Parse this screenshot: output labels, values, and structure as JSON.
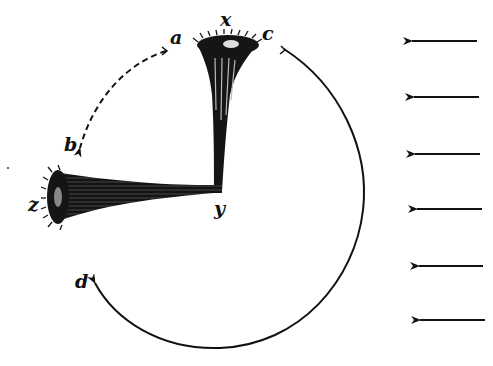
{
  "figure": {
    "labels": {
      "a": "a",
      "b": "b",
      "c": "c",
      "d": "d",
      "x": "x",
      "y": "y",
      "z": "z"
    },
    "colors": {
      "ink": "#111111",
      "background": "#ffffff"
    },
    "arrows": {
      "dashed_arc": {
        "from": "a",
        "to": "b",
        "style": "dashed"
      },
      "solid_arc": {
        "from": "c",
        "to": "d",
        "style": "solid",
        "direction": "clockwise"
      },
      "parallel_arrows": {
        "count": 6,
        "direction": "left"
      }
    },
    "organisms": [
      {
        "name": "upright-body",
        "from": "x",
        "to": "y"
      },
      {
        "name": "horizontal-body",
        "from": "z",
        "to": "y"
      }
    ]
  }
}
